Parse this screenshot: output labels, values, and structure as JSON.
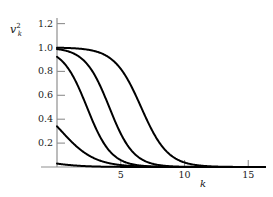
{
  "figure": {
    "background": "#ffffff",
    "axis_color": "#8c8c8c",
    "curve_color": "#000000"
  },
  "labels": {
    "ylabel_base": "v",
    "ylabel_sup": "2",
    "ylabel_sub": "k",
    "xlabel": "k"
  },
  "chart_data": {
    "type": "line",
    "title": "",
    "xlabel": "k",
    "ylabel": "v_k^2",
    "xlim": [
      0,
      16.3
    ],
    "ylim": [
      0,
      1.3
    ],
    "grid": false,
    "legend": "none",
    "xticks": [
      5,
      10,
      15
    ],
    "xticklabels": [
      "5",
      "10",
      "15"
    ],
    "yticks": [
      0.2,
      0.4,
      0.6,
      0.8,
      1.0,
      1.2
    ],
    "yticklabels": [
      "0.2",
      "0.4",
      "0.6",
      "0.8",
      "1.0",
      "1.2"
    ],
    "series": [
      {
        "name": "curve-1",
        "midpoint": -1.0,
        "width": 1.35,
        "plateau": 0.088,
        "x": [
          0.0,
          0.3,
          0.6,
          0.9,
          1.2,
          1.5,
          1.8,
          2.1,
          2.4,
          2.7,
          3.0,
          3.4,
          3.8,
          4.2,
          4.6,
          5.0,
          5.6,
          6.2,
          7.0,
          8.0,
          9.5,
          11.0,
          13.0,
          16.3
        ],
        "y": [
          0.088,
          0.072,
          0.058,
          0.047,
          0.038,
          0.031,
          0.025,
          0.02,
          0.016,
          0.013,
          0.011,
          0.0085,
          0.0066,
          0.0051,
          0.004,
          0.0031,
          0.0021,
          0.0015,
          0.0009,
          0.0005,
          0.0002,
          0.0001,
          5e-05,
          0.0
        ]
      },
      {
        "name": "curve-2",
        "midpoint": 0.35,
        "width": 1.3,
        "plateau": 0.6,
        "x": [
          0.0,
          0.3,
          0.6,
          0.9,
          1.2,
          1.5,
          1.8,
          2.1,
          2.4,
          2.7,
          3.0,
          3.4,
          3.8,
          4.2,
          4.6,
          5.0,
          5.5,
          6.0,
          6.8,
          7.6,
          8.6,
          10.0,
          12.0,
          14.0,
          16.3
        ],
        "y": [
          0.6,
          0.544,
          0.485,
          0.425,
          0.367,
          0.313,
          0.263,
          0.219,
          0.181,
          0.148,
          0.12,
          0.09,
          0.067,
          0.049,
          0.036,
          0.026,
          0.017,
          0.011,
          0.0055,
          0.0027,
          0.0011,
          0.00035,
          8e-05,
          2e-05,
          0.0
        ]
      },
      {
        "name": "curve-3",
        "midpoint": 2.35,
        "width": 0.95,
        "plateau": 1.0,
        "x": [
          0.0,
          0.4,
          0.8,
          1.1,
          1.4,
          1.7,
          2.0,
          2.35,
          2.7,
          3.0,
          3.3,
          3.7,
          4.1,
          4.5,
          5.0,
          5.5,
          6.0,
          6.8,
          7.6,
          8.6,
          10.0,
          12.0,
          14.0,
          16.3
        ],
        "y": [
          0.999,
          0.997,
          0.993,
          0.986,
          0.975,
          0.954,
          0.912,
          0.5,
          0.26,
          0.146,
          0.08,
          0.036,
          0.016,
          0.0073,
          0.0025,
          0.0009,
          0.0003,
          6e-05,
          1e-05,
          0.0,
          0.0,
          0.0,
          0.0,
          0.0
        ]
      },
      {
        "name": "curve-4",
        "midpoint": 4.1,
        "width": 0.95,
        "plateau": 1.0,
        "x": [
          0.0,
          0.8,
          1.6,
          2.2,
          2.8,
          3.2,
          3.5,
          3.8,
          4.1,
          4.4,
          4.7,
          5.0,
          5.4,
          5.8,
          6.3,
          6.9,
          7.6,
          8.5,
          9.5,
          11.0,
          13.0,
          16.3
        ],
        "y": [
          1.0,
          1.0,
          0.999,
          0.997,
          0.988,
          0.972,
          0.943,
          0.878,
          0.5,
          0.201,
          0.082,
          0.036,
          0.013,
          0.005,
          0.0015,
          0.0004,
          0.0001,
          2e-05,
          0.0,
          0.0,
          0.0,
          0.0
        ]
      },
      {
        "name": "curve-5",
        "midpoint": 6.6,
        "width": 1.05,
        "plateau": 1.0,
        "x": [
          0.0,
          1.5,
          3.0,
          4.2,
          5.0,
          5.5,
          5.9,
          6.2,
          6.6,
          7.0,
          7.4,
          7.8,
          8.3,
          8.8,
          9.4,
          10.1,
          11.0,
          12.0,
          13.2,
          14.5,
          16.3
        ],
        "y": [
          1.0,
          1.0,
          1.0,
          0.999,
          0.994,
          0.985,
          0.967,
          0.93,
          0.5,
          0.23,
          0.097,
          0.04,
          0.014,
          0.005,
          0.0016,
          0.0005,
          0.0001,
          3e-05,
          0.0,
          0.0,
          0.0
        ]
      }
    ]
  },
  "geometry": {
    "origin_x": 57,
    "origin_y": 167,
    "px_per_k": 12.75,
    "px_per_unit_y": 119.5,
    "axis_right": 256,
    "axis_top": 18
  }
}
